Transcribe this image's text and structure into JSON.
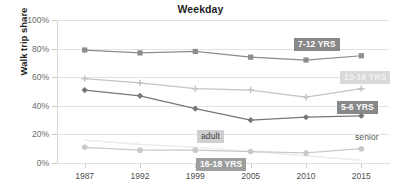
{
  "chart_data": {
    "type": "line",
    "title": "Weekday",
    "xlabel": "",
    "ylabel": "Walk trip share",
    "x": [
      "1987",
      "1992",
      "1999",
      "2005",
      "2010",
      "2015"
    ],
    "categories": [
      "1987",
      "1992",
      "1999",
      "2005",
      "2010",
      "2015"
    ],
    "ylim": [
      0,
      100
    ],
    "ytick_labels": [
      "0%",
      "20%",
      "40%",
      "60%",
      "80%",
      "100%"
    ],
    "ytick_values": [
      0,
      20,
      40,
      60,
      80,
      100
    ],
    "grid": true,
    "legend_position": "inline-annotations",
    "y_unit": "%",
    "series": [
      {
        "name": "7-12 YRS",
        "values": [
          79,
          77,
          78,
          74,
          72,
          75
        ],
        "color": "#8c8c8c",
        "marker": "square",
        "label_style": "dark",
        "annotation": "7-12 YRS"
      },
      {
        "name": "13-16 YRS",
        "values": [
          59,
          56,
          52,
          51,
          46,
          52
        ],
        "color": "#c4c4c4",
        "marker": "plus",
        "label_style": "light",
        "annotation": "13-16 YRS"
      },
      {
        "name": "5-6 YRS",
        "values": [
          51,
          47,
          38,
          30,
          32,
          33
        ],
        "color": "#767676",
        "marker": "diamond",
        "label_style": "dark",
        "annotation": "5-6 YRS"
      },
      {
        "name": "adult",
        "values": [
          16,
          13,
          11,
          8,
          5,
          2
        ],
        "color": "#e8e8e8",
        "marker": "none",
        "label_style": "grey-on-light",
        "annotation": "adult"
      },
      {
        "name": "senior",
        "values": [
          16,
          13,
          11,
          8,
          5,
          2
        ],
        "color": "#eeeeee",
        "marker": "none",
        "label_style": "plain",
        "annotation": "senior"
      },
      {
        "name": "16-18 YRS",
        "values": [
          11,
          9,
          9,
          8,
          7,
          10
        ],
        "color": "#c9c9c9",
        "marker": "circle",
        "label_style": "mid",
        "annotation": "16-18 YRS"
      }
    ],
    "annotations": [
      {
        "text": "7-12 YRS",
        "style": "dark",
        "x": 294,
        "y": 38
      },
      {
        "text": "13-16 YRS",
        "style": "light",
        "x": 340,
        "y": 71
      },
      {
        "text": "5-6 YRS",
        "style": "dark",
        "x": 337,
        "y": 101
      },
      {
        "text": "adult",
        "style": "grey-on-light",
        "x": 197,
        "y": 130
      },
      {
        "text": "senior",
        "style": "plain",
        "x": 351,
        "y": 131
      },
      {
        "text": "16-18 YRS",
        "style": "mid",
        "x": 196,
        "y": 158
      }
    ]
  }
}
